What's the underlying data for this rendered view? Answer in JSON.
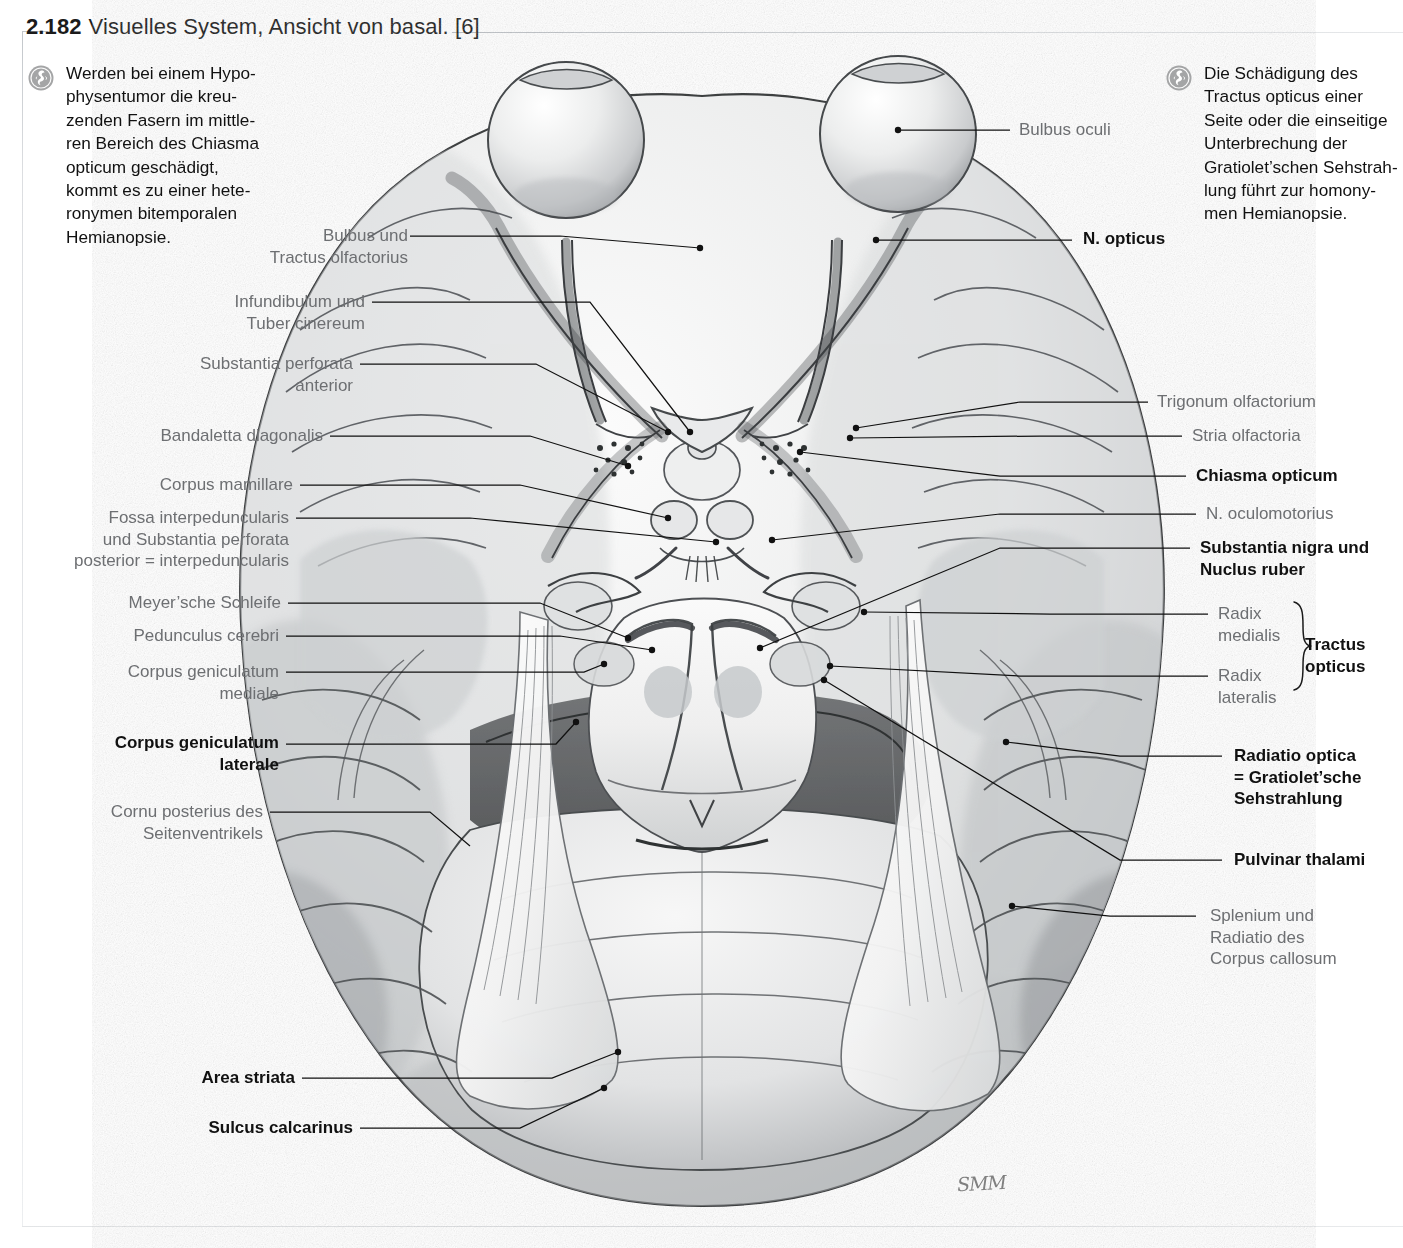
{
  "title": {
    "number": "2.182",
    "text": "Visuelles System, Ansicht von basal. [6]"
  },
  "clinical_notes": [
    {
      "side": "left",
      "icon": "clinical-badge-icon",
      "lines": [
        "Werden bei einem Hypo-",
        "physentumor die kreu-",
        "zenden Fasern im mittle-",
        "ren Bereich des Chiasma",
        "opticum geschädigt,",
        "kommt es zu einer hete-",
        "ronymen bitemporalen",
        "Hemianopsie."
      ]
    },
    {
      "side": "right",
      "icon": "clinical-badge-icon",
      "lines": [
        "Die Schädigung des",
        "Tractus opticus einer",
        "Seite oder die einseitige",
        "Unterbrechung der",
        "Gratiolet’schen Sehstrah-",
        "lung führt zur homony-",
        "men Hemianopsie."
      ]
    }
  ],
  "labels_left": [
    {
      "id": "bulbus-tractus-olfactorius",
      "lines": [
        "Bulbus und",
        "Tractus olfactorius"
      ],
      "bold": false
    },
    {
      "id": "infundibulum-tuber-cinereum",
      "lines": [
        "Infundibulum und",
        "Tuber cinereum"
      ],
      "bold": false
    },
    {
      "id": "substantia-perforata-anterior",
      "lines": [
        "Substantia perforata",
        "anterior"
      ],
      "bold": false
    },
    {
      "id": "bandaletta-diagonalis",
      "lines": [
        "Bandaletta diagonalis"
      ],
      "bold": false
    },
    {
      "id": "corpus-mamillare",
      "lines": [
        "Corpus mamillare"
      ],
      "bold": false
    },
    {
      "id": "fossa-interpeduncularis",
      "lines": [
        "Fossa interpeduncularis",
        "und Substantia perforata",
        "posterior = interpeduncularis"
      ],
      "bold": false
    },
    {
      "id": "meyersche-schleife",
      "lines": [
        "Meyer’sche Schleife"
      ],
      "bold": false
    },
    {
      "id": "pedunculus-cerebri",
      "lines": [
        "Pedunculus cerebri"
      ],
      "bold": false
    },
    {
      "id": "corpus-geniculatum-mediale",
      "lines": [
        "Corpus geniculatum",
        "mediale"
      ],
      "bold": false
    },
    {
      "id": "corpus-geniculatum-laterale",
      "lines": [
        "Corpus geniculatum",
        "laterale"
      ],
      "bold": true
    },
    {
      "id": "cornu-posterius-seitenventrikels",
      "lines": [
        "Cornu posterius des",
        "Seitenventrikels"
      ],
      "bold": false
    },
    {
      "id": "area-striata",
      "lines": [
        "Area striata"
      ],
      "bold": true
    },
    {
      "id": "sulcus-calcarinus",
      "lines": [
        "Sulcus calcarinus"
      ],
      "bold": true
    }
  ],
  "labels_right": [
    {
      "id": "bulbus-oculi",
      "lines": [
        "Bulbus oculi"
      ],
      "bold": false
    },
    {
      "id": "n-opticus",
      "lines": [
        "N. opticus"
      ],
      "bold": true
    },
    {
      "id": "trigonum-olfactorium",
      "lines": [
        "Trigonum olfactorium"
      ],
      "bold": false
    },
    {
      "id": "stria-olfactoria",
      "lines": [
        "Stria olfactoria"
      ],
      "bold": false
    },
    {
      "id": "chiasma-opticum",
      "lines": [
        "Chiasma opticum"
      ],
      "bold": true
    },
    {
      "id": "n-oculomotorius",
      "lines": [
        "N. oculomotorius"
      ],
      "bold": false
    },
    {
      "id": "substantia-nigra-nucleus-ruber",
      "lines": [
        "Substantia nigra und",
        "Nuclus ruber"
      ],
      "bold": true
    },
    {
      "id": "radix-medialis",
      "lines": [
        "Radix",
        "medialis"
      ],
      "bold": false
    },
    {
      "id": "radix-lateralis",
      "lines": [
        "Radix",
        "lateralis"
      ],
      "bold": false
    },
    {
      "id": "tractus-opticus-group",
      "lines": [
        "Tractus",
        "opticus"
      ],
      "bold": true
    },
    {
      "id": "radiatio-optica",
      "lines": [
        "Radiatio optica",
        "= Gratiolet’sche",
        "Sehstrahlung"
      ],
      "bold": true
    },
    {
      "id": "pulvinar-thalami",
      "lines": [
        "Pulvinar thalami"
      ],
      "bold": true
    },
    {
      "id": "splenium-radiatio-corpus-callosum",
      "lines": [
        "Splenium und",
        "Radiatio des",
        "Corpus callosum"
      ],
      "bold": false
    }
  ],
  "figure": {
    "caption_alt": "Gehirn von basal, Pinselzeichnung",
    "signature": "SMM",
    "colors": {
      "label_gray": "#6d6f72",
      "label_bold": "#111111",
      "leader_line": "#111111",
      "rule": "#c9cdd1",
      "badge": "#9a9a9a"
    }
  }
}
